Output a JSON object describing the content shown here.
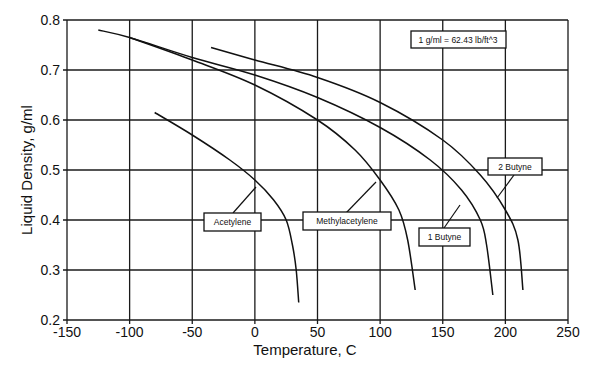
{
  "chart_data": {
    "type": "line",
    "title": "",
    "xlabel": "Temperature, C",
    "ylabel": "Liquid Density, g/ml",
    "xlim": [
      -150,
      250
    ],
    "ylim": [
      0.2,
      0.8
    ],
    "x_ticks": [
      -150,
      -100,
      -50,
      0,
      50,
      100,
      150,
      200,
      250
    ],
    "x_tick_labels": [
      "-150",
      "-100",
      "-50",
      "0",
      "50",
      "100",
      "150",
      "200",
      "250"
    ],
    "y_ticks": [
      0.2,
      0.3,
      0.4,
      0.5,
      0.6,
      0.7,
      0.8
    ],
    "y_tick_labels": [
      "0.2",
      "0.3",
      "0.4",
      "0.5",
      "0.6",
      "0.7",
      "0.8"
    ],
    "grid": true,
    "legend": "inline labels with leader lines",
    "annotation": "1 g/ml = 62.43 lb/ft^3",
    "series": [
      {
        "name": "Acetylene",
        "x": [
          -80,
          -50,
          -20,
          0,
          15,
          25,
          30,
          33,
          35
        ],
        "y": [
          0.615,
          0.57,
          0.52,
          0.48,
          0.44,
          0.4,
          0.35,
          0.3,
          0.235
        ]
      },
      {
        "name": "Methylacetylene",
        "x": [
          -100,
          -50,
          0,
          50,
          80,
          100,
          115,
          122,
          128
        ],
        "y": [
          0.765,
          0.72,
          0.67,
          0.6,
          0.54,
          0.48,
          0.42,
          0.36,
          0.26
        ]
      },
      {
        "name": "1 Butyne",
        "x": [
          -125,
          -100,
          -50,
          0,
          50,
          100,
          140,
          165,
          180,
          185,
          190
        ],
        "y": [
          0.78,
          0.765,
          0.725,
          0.69,
          0.645,
          0.585,
          0.52,
          0.46,
          0.4,
          0.35,
          0.25
        ]
      },
      {
        "name": "2 Butyne",
        "x": [
          -35,
          0,
          50,
          100,
          150,
          180,
          200,
          210,
          214
        ],
        "y": [
          0.745,
          0.72,
          0.685,
          0.635,
          0.56,
          0.49,
          0.42,
          0.36,
          0.26
        ]
      }
    ]
  },
  "labels": {
    "acetylene": "Acetylene",
    "methylacetylene": "Methylacetylene",
    "butyne1": "1 Butyne",
    "butyne2": "2 Butyne",
    "conversion": "1 g/ml = 62.43 lb/ft^3"
  }
}
